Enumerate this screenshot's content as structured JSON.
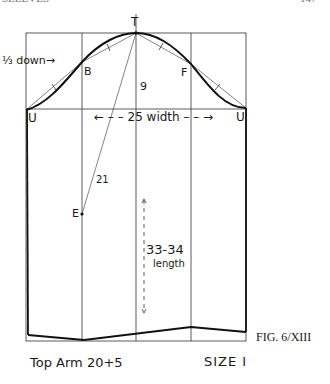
{
  "header": {
    "left": "SLEEVES",
    "page_number": "147"
  },
  "points": {
    "T": "T",
    "B": "B",
    "F": "F",
    "U_left": "U",
    "U_right": "U",
    "E": "E"
  },
  "annotations": {
    "third_down": "⅓ down→",
    "cap_height": "9",
    "width": "←  –  – 25 width  – – →",
    "elbow_line": "21",
    "length_value": "33-34",
    "length_word": "length"
  },
  "caption": {
    "figure": "FIG. 6/XIII",
    "top_arm": "Top Arm 20+5",
    "size": "SIZE I"
  },
  "colors": {
    "line": "#1a1a1a",
    "grid": "#333333",
    "background": "#ffffff"
  }
}
